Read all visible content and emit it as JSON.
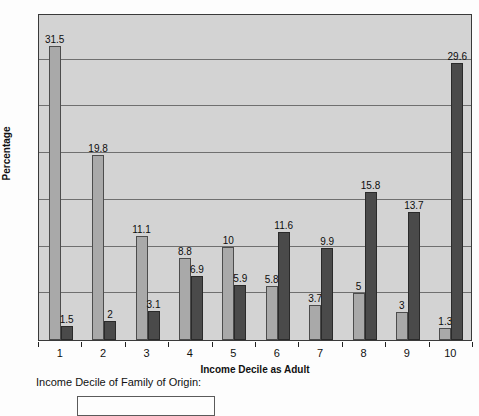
{
  "chart_data": {
    "type": "bar",
    "title": "",
    "xlabel": "Income Decile as Adult",
    "ylabel": "Percentage",
    "categories": [
      "1",
      "2",
      "3",
      "4",
      "5",
      "6",
      "7",
      "8",
      "9",
      "10"
    ],
    "series": [
      {
        "name": "series-light",
        "color": "#a9a9a9",
        "values": [
          31.5,
          19.8,
          11.1,
          8.8,
          10,
          5.8,
          3.7,
          5,
          3,
          1.3
        ]
      },
      {
        "name": "series-dark",
        "color": "#4a4a4a",
        "values": [
          1.5,
          2,
          3.1,
          6.9,
          5.9,
          11.6,
          9.9,
          15.8,
          13.7,
          29.6
        ]
      }
    ],
    "value_labels": [
      [
        "31.5",
        "19.8",
        "11.1",
        "8.8",
        "10",
        "5.8",
        "3.7",
        "5",
        "3",
        "1.3"
      ],
      [
        "1.5",
        "2",
        "3.1",
        "6.9",
        "5.9",
        "11.6",
        "9.9",
        "15.8",
        "13.7",
        "29.6"
      ]
    ],
    "ylim": [
      0,
      35
    ],
    "yticks": [
      0,
      5,
      10,
      15,
      20,
      25,
      30,
      35
    ],
    "ytick_labels": [
      "0",
      "5",
      "10",
      "15",
      "20",
      "25",
      "30",
      "35"
    ],
    "grid": true,
    "legend_position": "below",
    "plot_background": "#d3d3d3"
  },
  "legend": {
    "caption": "Income Decile of Family of Origin:"
  }
}
